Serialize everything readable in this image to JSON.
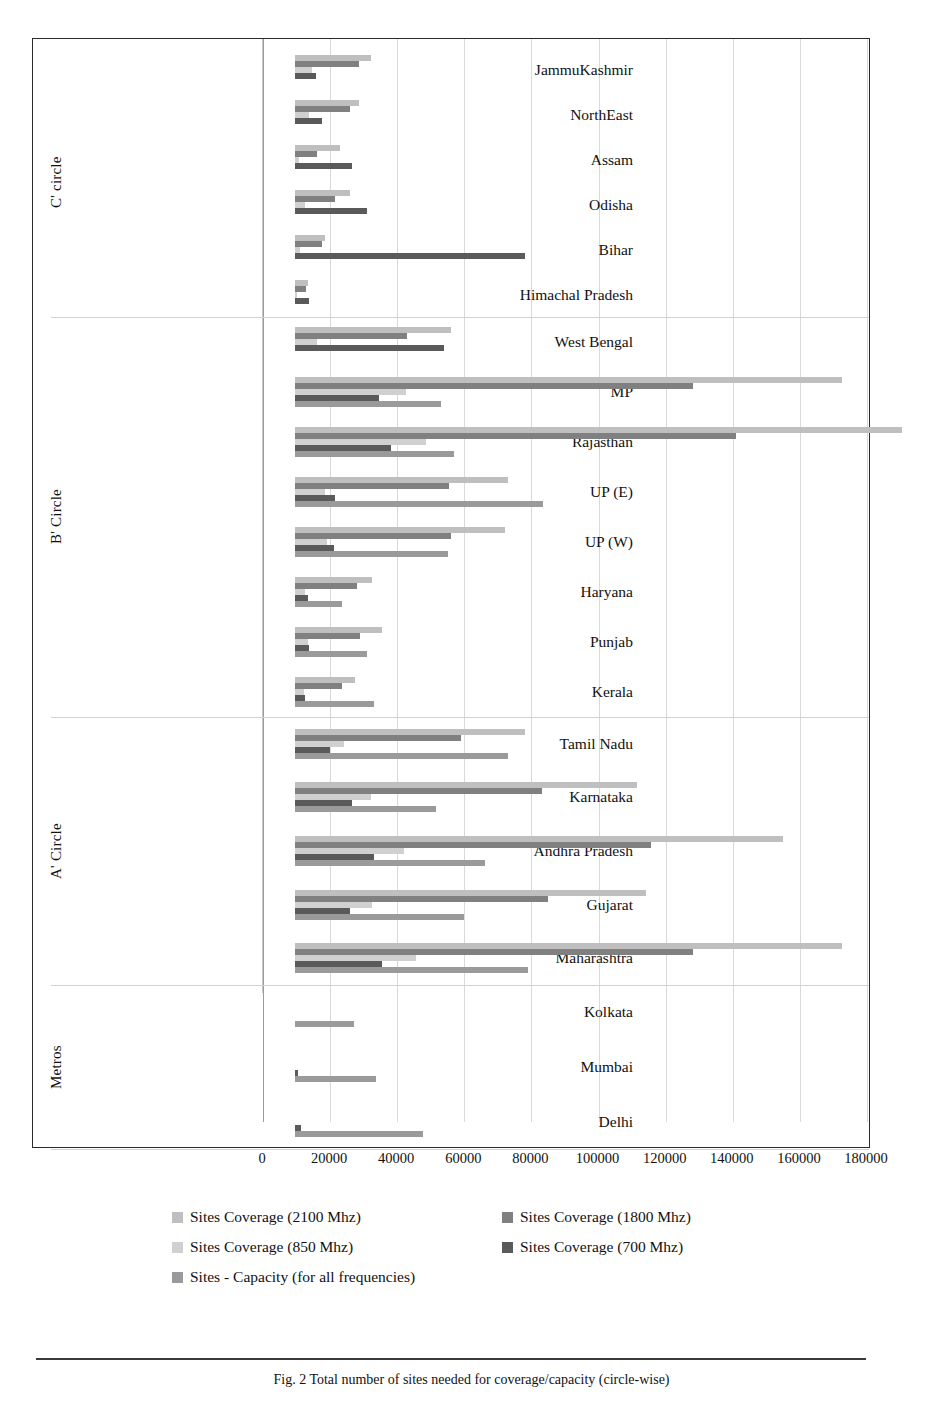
{
  "figure": {
    "caption": "Fig. 2   Total number of sites needed for coverage/capacity (circle-wise)"
  },
  "chart_data": {
    "type": "bar",
    "orientation": "horizontal",
    "title": "",
    "xlabel": "",
    "ylabel": "",
    "xlim": [
      0,
      180000
    ],
    "xticks": [
      0,
      20000,
      40000,
      60000,
      80000,
      100000,
      120000,
      140000,
      160000,
      180000
    ],
    "xtick_labels": [
      "0",
      "20000",
      "40000",
      "60000",
      "80000",
      "100000",
      "120000",
      "140000",
      "160000",
      "180000"
    ],
    "grid": true,
    "legend_position": "bottom",
    "series": [
      {
        "name": "Sites Coverage (2100 Mhz)",
        "color": "#bfbfbf"
      },
      {
        "name": "Sites Coverage (1800 Mhz)",
        "color": "#808080"
      },
      {
        "name": "Sites Coverage (850 Mhz)",
        "color": "#d0d0d0"
      },
      {
        "name": "Sites Coverage (700 Mhz)",
        "color": "#5a5a5a"
      },
      {
        "name": "Sites - Capacity (for all frequencies)",
        "color": "#9a9a9a"
      }
    ],
    "groups": [
      {
        "label": "C' circle",
        "categories": [
          {
            "name": "JammuKashmir",
            "values": [
              22500,
              19000,
              5000,
              6200,
              0
            ]
          },
          {
            "name": "NorthEast",
            "values": [
              19000,
              16500,
              4200,
              8000,
              0
            ]
          },
          {
            "name": "Assam",
            "values": [
              13500,
              6500,
              1200,
              17000,
              0
            ]
          },
          {
            "name": "Odisha",
            "values": [
              16500,
              12000,
              3000,
              21500,
              0
            ]
          },
          {
            "name": "Bihar",
            "values": [
              9000,
              8000,
              1500,
              68500,
              0
            ]
          },
          {
            "name": "Himachal Pradesh",
            "values": [
              4000,
              3200,
              700,
              4200,
              0
            ]
          }
        ]
      },
      {
        "label": "B' Circle",
        "categories": [
          {
            "name": "West Bengal",
            "values": [
              46500,
              33500,
              6500,
              44500,
              0
            ]
          },
          {
            "name": "MP",
            "values": [
              163000,
              118500,
              33000,
              25000,
              43500
            ]
          },
          {
            "name": "Rajasthan",
            "values": [
              181000,
              131500,
              39000,
              28500,
              47500
            ]
          },
          {
            "name": "UP (E)",
            "values": [
              63500,
              46000,
              9000,
              12000,
              74000
            ]
          },
          {
            "name": "UP (W)",
            "values": [
              62500,
              46500,
              9500,
              11500,
              45500
            ]
          },
          {
            "name": "Haryana",
            "values": [
              23000,
              18500,
              3000,
              3800,
              14000
            ]
          },
          {
            "name": "Punjab",
            "values": [
              26000,
              19500,
              4000,
              4200,
              21500
            ]
          },
          {
            "name": "Kerala",
            "values": [
              18000,
              14000,
              2600,
              3000,
              23500
            ]
          }
        ]
      },
      {
        "label": "A' Circle",
        "categories": [
          {
            "name": "Tamil Nadu",
            "values": [
              68500,
              49500,
              14500,
              10500,
              63500
            ]
          },
          {
            "name": "Karnataka",
            "values": [
              102000,
              73500,
              22500,
              17000,
              42000
            ]
          },
          {
            "name": "Andhra Pradesh",
            "values": [
              145500,
              106000,
              32500,
              23500,
              56500
            ]
          },
          {
            "name": "Gujarat",
            "values": [
              104500,
              75500,
              23000,
              16500,
              50500
            ]
          },
          {
            "name": "Maharashtra",
            "values": [
              163000,
              118500,
              36000,
              26000,
              69500
            ]
          }
        ]
      },
      {
        "label": "Metros",
        "categories": [
          {
            "name": "Kolkata",
            "values": [
              0,
              0,
              0,
              0,
              17500
            ]
          },
          {
            "name": "Mumbai",
            "values": [
              0,
              0,
              0,
              1000,
              24000
            ]
          },
          {
            "name": "Delhi",
            "values": [
              0,
              0,
              0,
              1800,
              38000
            ]
          }
        ]
      }
    ]
  }
}
